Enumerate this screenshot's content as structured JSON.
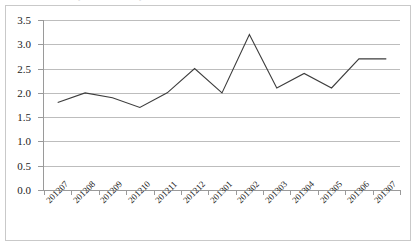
{
  "chart_data": {
    "type": "line",
    "title": "",
    "subtitle": "",
    "xlabel": "",
    "ylabel": "",
    "categories": [
      "201207",
      "201208",
      "201209",
      "201210",
      "201211",
      "201212",
      "201301",
      "201302",
      "201303",
      "201304",
      "201305",
      "201306",
      "201307"
    ],
    "values": [
      1.8,
      2.0,
      1.9,
      1.7,
      2.0,
      2.5,
      2.0,
      3.2,
      2.1,
      2.4,
      2.1,
      2.7,
      2.7
    ],
    "series": [
      {
        "name": "",
        "values": [
          1.8,
          2.0,
          1.9,
          1.7,
          2.0,
          2.5,
          2.0,
          3.2,
          2.1,
          2.4,
          2.1,
          2.7,
          2.7
        ]
      }
    ],
    "ylim": [
      0.0,
      3.5
    ],
    "ytick_labels": [
      "3.5",
      "3.0",
      "2.5",
      "2.0",
      "1.5",
      "1.0",
      "0.5",
      "0.0"
    ],
    "ytick_values": [
      3.5,
      3.0,
      2.5,
      2.0,
      1.5,
      1.0,
      0.5,
      0.0
    ],
    "ytick_step": 0.5,
    "grid": true,
    "grid_axis": "y",
    "legend": false,
    "legend_position": "none",
    "line_color": "#3d3d3d",
    "grid_color": "#bdbdbd",
    "axis_color": "#9a9a9a",
    "background_color": "#ffffff",
    "border_color": "#c9c9c9",
    "markers": false,
    "xtick_label_rotation": -45,
    "annotations": []
  },
  "figure": {
    "frame_border_color": "#c9c9c9",
    "ghost_marks": [
      "⌄",
      "⌄"
    ]
  }
}
